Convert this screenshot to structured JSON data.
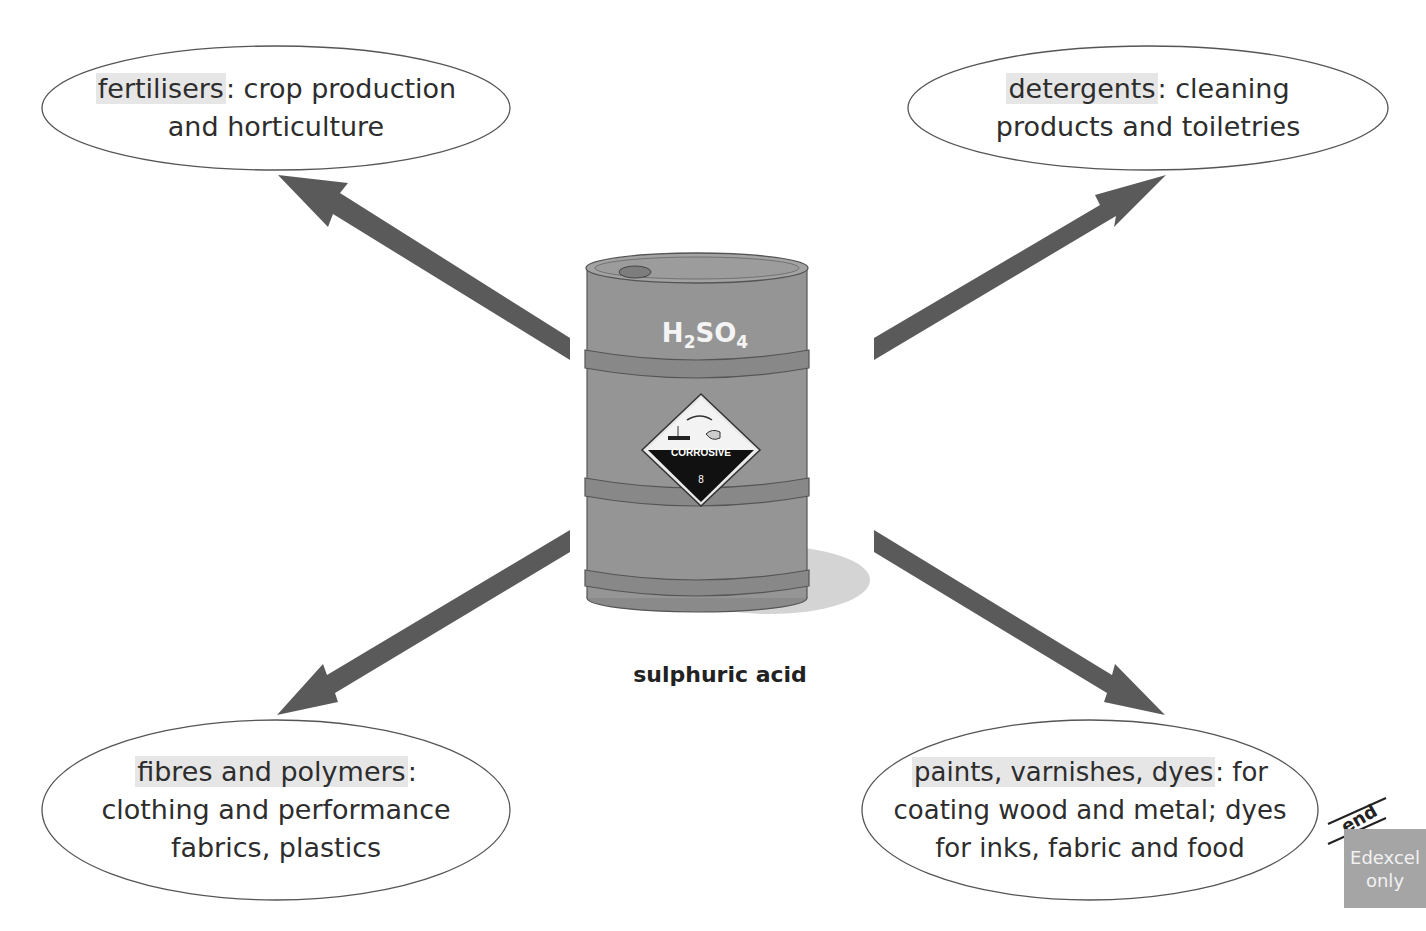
{
  "top_text_fragment": "",
  "center": {
    "formula": {
      "main": "H",
      "sub1": "2",
      "mid": "SO",
      "sub2": "4"
    },
    "hazard_label": {
      "text": "CORROSIVE",
      "class_number": "8"
    },
    "caption": "sulphuric acid"
  },
  "uses": [
    {
      "keyword": "fertilisers",
      "rest_line1": ": crop production",
      "line2": "and horticulture",
      "line3": ""
    },
    {
      "keyword": "detergents",
      "rest_line1": ": cleaning",
      "line2": "products and toiletries",
      "line3": ""
    },
    {
      "keyword": "fibres and polymers",
      "rest_line1": ":",
      "line2": "clothing and performance",
      "line3": "fabrics, plastics"
    },
    {
      "keyword": "paints, varnishes, dyes",
      "rest_line1": ": for",
      "line2": "coating wood and metal; dyes",
      "line3": "for inks, fabric and food"
    }
  ],
  "margin_marker": {
    "end_label": "end",
    "badge_line1": "Edexcel",
    "badge_line2": "only"
  },
  "colors": {
    "arrow": "#5a5a5a",
    "barrel": "#8f8f8f",
    "highlight": "#e6e6e6",
    "badge": "#a5a5a5"
  }
}
